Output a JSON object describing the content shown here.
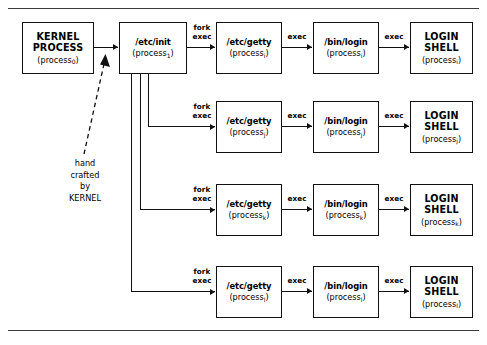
{
  "kernel": {
    "name_line1": "KERNEL",
    "name_line2": "PROCESS",
    "pid_prefix": "(process",
    "pid_sub": "0",
    "pid_suffix": ")"
  },
  "init": {
    "name": "/etc/init",
    "pid_prefix": "(process",
    "pid_sub": "1",
    "pid_suffix": ")"
  },
  "labels": {
    "fork": "fork",
    "exec": "exec",
    "exec_single": "exec"
  },
  "annotation": {
    "line1": "hand",
    "line2": "crafted",
    "line3": "by",
    "line4": "KERNEL"
  },
  "rows": [
    {
      "subscript": "i",
      "getty": "/etc/getty",
      "login": "/bin/login",
      "shell_line1": "LOGIN",
      "shell_line2": "SHELL",
      "pid_prefix": "(process",
      "pid_suffix": ")"
    },
    {
      "subscript": "j",
      "getty": "/etc/getty",
      "login": "/bin/login",
      "shell_line1": "LOGIN",
      "shell_line2": "SHELL",
      "pid_prefix": "(process",
      "pid_suffix": ")"
    },
    {
      "subscript": "k",
      "getty": "/etc/getty",
      "login": "/bin/login",
      "shell_line1": "LOGIN",
      "shell_line2": "SHELL",
      "pid_prefix": "(process",
      "pid_suffix": ")"
    },
    {
      "subscript": "l",
      "getty": "/etc/getty",
      "login": "/bin/login",
      "shell_line1": "LOGIN",
      "shell_line2": "SHELL",
      "pid_prefix": "(process",
      "pid_suffix": ")"
    }
  ],
  "colors": {
    "ink": "#111111",
    "rule": "#3a3a3a",
    "paper": "#ffffff"
  }
}
